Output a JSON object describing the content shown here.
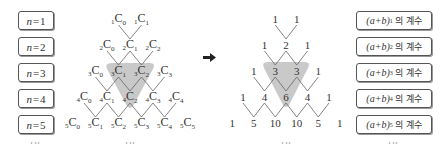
{
  "left_labels": [
    "n=1",
    "n=2",
    "n=3",
    "n=4",
    "n=5"
  ],
  "left_label_parts": [
    {
      "var": "n",
      "eq": "=",
      "num": "1"
    },
    {
      "var": "n",
      "eq": "=",
      "num": "2"
    },
    {
      "var": "n",
      "eq": "=",
      "num": "3"
    },
    {
      "var": "n",
      "eq": "=",
      "num": "4"
    },
    {
      "var": "n",
      "eq": "=",
      "num": "5"
    }
  ],
  "right_labels": [
    {
      "base": "(a+b)",
      "exp": "1",
      "suffix": "의 계수"
    },
    {
      "base": "(a+b)",
      "exp": "2",
      "suffix": "의 계수"
    },
    {
      "base": "(a+b)",
      "exp": "3",
      "suffix": "의 계수"
    },
    {
      "base": "(a+b)",
      "exp": "4",
      "suffix": "의 계수"
    },
    {
      "base": "(a+b)",
      "exp": "5",
      "suffix": "의 계수"
    }
  ],
  "combination_triangle": {
    "rows": [
      [
        {
          "n": "1",
          "r": "0"
        },
        {
          "n": "1",
          "r": "1"
        }
      ],
      [
        {
          "n": "2",
          "r": "0"
        },
        {
          "n": "2",
          "r": "1"
        },
        {
          "n": "2",
          "r": "2"
        }
      ],
      [
        {
          "n": "3",
          "r": "0"
        },
        {
          "n": "3",
          "r": "1"
        },
        {
          "n": "3",
          "r": "2"
        },
        {
          "n": "3",
          "r": "3"
        }
      ],
      [
        {
          "n": "4",
          "r": "0"
        },
        {
          "n": "4",
          "r": "1"
        },
        {
          "n": "4",
          "r": "2"
        },
        {
          "n": "4",
          "r": "3"
        },
        {
          "n": "4",
          "r": "4"
        }
      ],
      [
        {
          "n": "5",
          "r": "0"
        },
        {
          "n": "5",
          "r": "1"
        },
        {
          "n": "5",
          "r": "2"
        },
        {
          "n": "5",
          "r": "3"
        },
        {
          "n": "5",
          "r": "4"
        },
        {
          "n": "5",
          "r": "5"
        }
      ]
    ],
    "letter": "C",
    "highlight": [
      "3C1",
      "3C2",
      "4C2"
    ]
  },
  "pascal_triangle": {
    "rows": [
      [
        "1",
        "1"
      ],
      [
        "1",
        "2",
        "1"
      ],
      [
        "1",
        "3",
        "3",
        "1"
      ],
      [
        "1",
        "4",
        "6",
        "4",
        "1"
      ],
      [
        "1",
        "5",
        "10",
        "10",
        "5",
        "1"
      ]
    ],
    "highlight": [
      "3",
      "3",
      "6"
    ]
  },
  "arrow": "➡",
  "ellipsis": "⋮",
  "colors": {
    "highlight": "#c9c9c9",
    "line": "#666666",
    "box_border": "#555555"
  }
}
